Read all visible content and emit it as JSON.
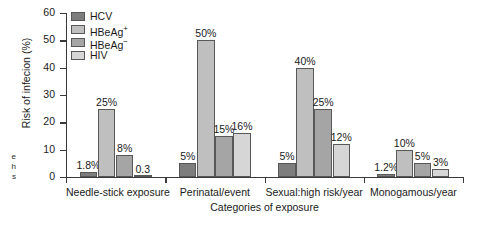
{
  "chart_data": {
    "type": "bar",
    "title": "",
    "xlabel": "Categories of exposure",
    "ylabel": "Risk of infecion (%)",
    "ylim": [
      0,
      60
    ],
    "yticks": [
      0,
      10,
      20,
      30,
      40,
      50,
      60
    ],
    "grid": false,
    "legend_position": "top-left",
    "categories": [
      "Needle-stick exposure",
      "Perinatal/event",
      "Sexual:high risk/year",
      "Monogamous/year"
    ],
    "series": [
      {
        "name": "HCV",
        "color": "#7d7d7d",
        "values": [
          1.8,
          5,
          5,
          1.2
        ],
        "labels": [
          "1.8%",
          "5%",
          "5%",
          "1.2%"
        ]
      },
      {
        "name": "HBeAg+",
        "color": "#bfbfbf",
        "values": [
          25,
          50,
          40,
          10
        ],
        "labels": [
          "25%",
          "50%",
          "40%",
          "10%"
        ]
      },
      {
        "name": "HBeAg−",
        "color": "#a5a5a5",
        "values": [
          8,
          15,
          25,
          5
        ],
        "labels": [
          "8%",
          "15%",
          "25%",
          "5%"
        ]
      },
      {
        "name": "HIV",
        "color": "#d6d6d6",
        "values": [
          0.3,
          16,
          12,
          3
        ],
        "labels": [
          "0.3",
          "16%",
          "12%",
          "3%"
        ]
      }
    ]
  },
  "legend": {
    "items": [
      {
        "label": "HCV",
        "sup": ""
      },
      {
        "label": "HBeAg",
        "sup": "+"
      },
      {
        "label": "HBeAg",
        "sup": "−"
      },
      {
        "label": "HIV",
        "sup": ""
      }
    ]
  },
  "caption_fragment": {
    "line1": "e",
    "line2": "h",
    "line3": "s"
  }
}
